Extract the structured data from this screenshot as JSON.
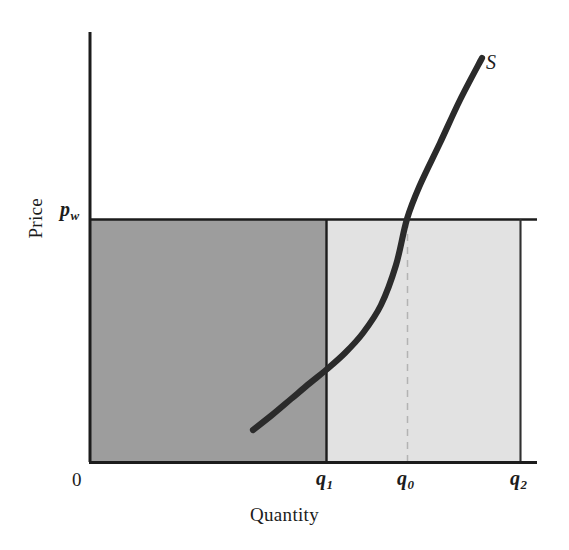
{
  "figure": {
    "background_color": "#ffffff",
    "ink_color": "#1c1c1c"
  },
  "axes": {
    "y_axis_title": "Price",
    "x_axis_title": "Quantity",
    "origin_label": "0"
  },
  "labels": {
    "price_level": "p",
    "price_level_subscript": "w",
    "supply_curve": "S",
    "q1_base": "q",
    "q1_subscript": "1",
    "q0_base": "q",
    "q0_subscript": "0",
    "q2_base": "q",
    "q2_subscript": "2"
  },
  "colors": {
    "domestic_region_fill": "#9d9d9d",
    "import_region_fill": "#e2e2e2",
    "curve_stroke": "#2b2b2b",
    "axis_stroke": "#1c1c1c",
    "dashed_stroke": "#b9b9b9"
  },
  "chart_data": {
    "type": "line",
    "title": "",
    "subtitle": "",
    "xlabel": "Quantity",
    "ylabel": "Price",
    "grid": false,
    "legend": "inline-curve-label",
    "axis_pixel_frame": {
      "x_axis_y": 462,
      "y_axis_x": 89,
      "x_axis_right_end": 537,
      "y_axis_top_end": 32
    },
    "x_tick_labels": [
      "0",
      "q₁",
      "q₀",
      "q₂"
    ],
    "x_tick_positions_px": [
      89,
      326,
      407,
      520
    ],
    "y_tick_labels": [
      "pᵥᵥ"
    ],
    "price_line": {
      "name": "p_w (world price)",
      "label": "p",
      "subscript": "w",
      "y_px": 219,
      "x_start_px": 89,
      "x_end_px": 537,
      "style": "solid",
      "note": "horizontal world-price line"
    },
    "series": [
      {
        "name": "S",
        "label": "S",
        "type": "line",
        "style": "solid",
        "shape": "upward-sloping convex supply curve",
        "points_px": [
          [
            253,
            430
          ],
          [
            272,
            415
          ],
          [
            291,
            399
          ],
          [
            310,
            383
          ],
          [
            326,
            370
          ],
          [
            345,
            353
          ],
          [
            363,
            333
          ],
          [
            381,
            305
          ],
          [
            396,
            265
          ],
          [
            407,
            219
          ],
          [
            420,
            185
          ],
          [
            440,
            143
          ],
          [
            460,
            100
          ],
          [
            482,
            58
          ]
        ],
        "crosses_price_line_at_px": [
          407,
          219
        ],
        "crosses_price_line_at_label": "q₀"
      }
    ],
    "regions": [
      {
        "name": "domestic-supply-region",
        "fill": "#9d9d9d",
        "x_from_px": 89,
        "x_to_px": 326,
        "y_top_px": 219,
        "y_bottom_px": 462,
        "x_from_label": "0",
        "x_to_label": "q₁"
      },
      {
        "name": "import-region",
        "fill": "#e2e2e2",
        "x_from_px": 326,
        "x_to_px": 520,
        "y_top_px": 219,
        "y_bottom_px": 462,
        "x_from_label": "q₁",
        "x_to_label": "q₂"
      }
    ],
    "vertical_lines": [
      {
        "name": "q1-line",
        "x_px": 326,
        "style": "solid",
        "label": "q₁",
        "y_top_px": 219,
        "y_bottom_px": 462
      },
      {
        "name": "q0-line",
        "x_px": 407,
        "style": "dashed",
        "label": "q₀",
        "y_top_px": 219,
        "y_bottom_px": 462
      },
      {
        "name": "q2-line",
        "x_px": 520,
        "style": "solid",
        "label": "q₂",
        "y_top_px": 219,
        "y_bottom_px": 462
      }
    ]
  }
}
